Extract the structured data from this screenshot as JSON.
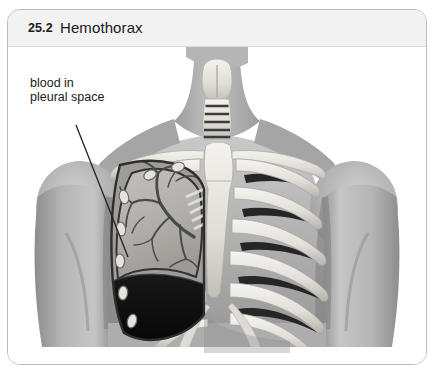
{
  "figure": {
    "number": "25.2",
    "title": "Hemothorax",
    "panel_border_color": "#b9bbbd",
    "title_bar_color": "#f2f2f2"
  },
  "annotations": [
    {
      "id": "blood-in-pleural-space",
      "text": "blood in\npleural space",
      "leader_line": {
        "x1": 68,
        "y1": 78,
        "x2": 120,
        "y2": 210
      }
    }
  ],
  "illustration": {
    "type": "anatomical-grayscale-illustration",
    "subject": "anterior thorax with hemothorax",
    "palette": {
      "background": "#ffffff",
      "body_light": "#cfcfcf",
      "body_mid": "#a9a9a9",
      "body_dark": "#8a8a8a",
      "body_shadow": "#6f6f6f",
      "bone_light": "#f0eeea",
      "bone_mid": "#d8d5cf",
      "bone_shadow": "#9d9a94",
      "lung_tissue": "#b4b2ae",
      "lung_outline": "#3a3a3a",
      "bronchi": "#4a4a4a",
      "blood": "#111111",
      "intercostal_dark": "#2b2b2b",
      "leader_line": "#222222",
      "text": "#1a1a1a"
    },
    "structures": [
      {
        "name": "neck",
        "label": "neck"
      },
      {
        "name": "thyroid-cartilage",
        "label": "thyroid cartilage"
      },
      {
        "name": "trachea",
        "label": "trachea",
        "ring_count": 5
      },
      {
        "name": "clavicle-left",
        "label": "left clavicle"
      },
      {
        "name": "clavicle-right",
        "label": "right clavicle"
      },
      {
        "name": "shoulder-left",
        "label": "left shoulder"
      },
      {
        "name": "shoulder-right",
        "label": "right shoulder"
      },
      {
        "name": "upper-arm-left",
        "label": "left upper arm"
      },
      {
        "name": "upper-arm-right",
        "label": "right upper arm"
      },
      {
        "name": "sternum",
        "label": "sternum"
      },
      {
        "name": "ribcage",
        "label": "rib cage",
        "rib_count": 7
      },
      {
        "name": "lung-cutaway",
        "label": "cutaway lung with bronchial tree"
      },
      {
        "name": "pleural-blood",
        "label": "blood collected in pleural space"
      },
      {
        "name": "diaphragm-shadow",
        "label": "diaphragm shadow"
      }
    ]
  }
}
